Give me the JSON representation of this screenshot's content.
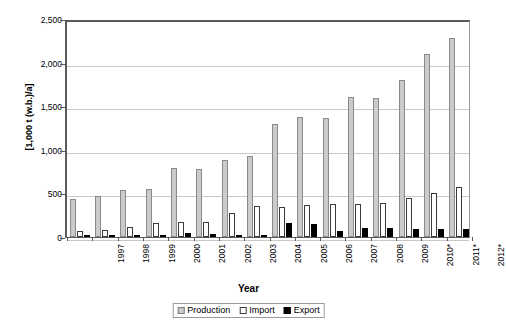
{
  "chart_data": {
    "type": "bar",
    "title": "",
    "xlabel": "Year",
    "ylabel": "[1,000 t (w.b.)/a]",
    "categories": [
      "1997",
      "1998",
      "1999",
      "2000",
      "2001",
      "2002",
      "2003",
      "2004",
      "2005",
      "2006",
      "2007",
      "2008",
      "2009",
      "2010*",
      "2011*",
      "2012*"
    ],
    "series": [
      {
        "name": "Production",
        "color": "#cbcbcb",
        "values": [
          435,
          470,
          540,
          555,
          790,
          775,
          880,
          930,
          1300,
          1375,
          1370,
          1600,
          1595,
          1805,
          2100,
          2280
        ]
      },
      {
        "name": "Import",
        "color": "#ffffff",
        "values": [
          65,
          85,
          120,
          155,
          175,
          175,
          270,
          350,
          340,
          365,
          380,
          380,
          390,
          450,
          505,
          570
        ]
      },
      {
        "name": "Export",
        "color": "#000000",
        "values": [
          5,
          10,
          20,
          25,
          45,
          40,
          15,
          25,
          155,
          145,
          70,
          105,
          105,
          95,
          95,
          90
        ]
      }
    ],
    "ylim": [
      0,
      2500
    ],
    "yticks": [
      0,
      500,
      1000,
      1500,
      2000,
      2500
    ],
    "ytick_labels": [
      "0",
      "500",
      "1,000",
      "1,500",
      "2,000",
      "2,500"
    ],
    "grid": true,
    "legend_position": "bottom-center"
  },
  "legend": {
    "items": [
      {
        "label": "Production",
        "swatch": "production-swatch"
      },
      {
        "label": "Import",
        "swatch": "import-swatch"
      },
      {
        "label": "Export",
        "swatch": "export-swatch"
      }
    ]
  },
  "axes": {
    "x_title": "Year",
    "y_title": "[1,000 t (w.b.)/a]"
  }
}
